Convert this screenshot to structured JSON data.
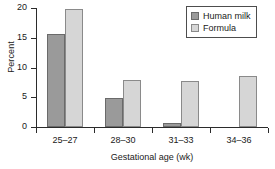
{
  "chart_data": {
    "type": "bar",
    "title": "",
    "xlabel": "Gestational age (wk)",
    "ylabel": "Percent",
    "categories": [
      "25–27",
      "28–30",
      "31–33",
      "34–36"
    ],
    "series": [
      {
        "name": "Human milk",
        "color": "#9a9a9a",
        "values": [
          15.6,
          4.9,
          0.6,
          0
        ]
      },
      {
        "name": "Formula",
        "color": "#d6d6d6",
        "values": [
          19.8,
          7.9,
          7.8,
          8.5
        ]
      }
    ],
    "ylim": [
      0,
      20
    ],
    "yticks": [
      0,
      5,
      10,
      15,
      20
    ],
    "ytick_labels": [
      "0",
      "5",
      "10",
      "15",
      "20"
    ],
    "grid": false,
    "legend_position": "top-right"
  },
  "legend": {
    "items": [
      {
        "label": "Human milk"
      },
      {
        "label": "Formula"
      }
    ]
  }
}
